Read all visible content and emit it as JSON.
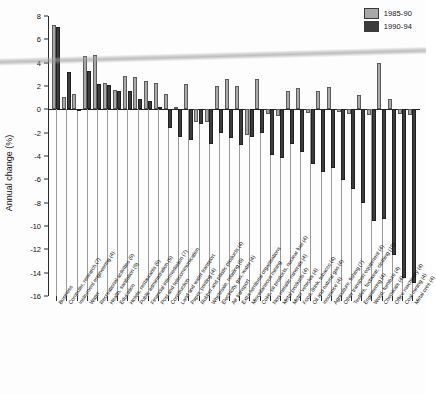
{
  "chart": {
    "ylabel": "Annual change (%)",
    "yticks": [
      8,
      6,
      4,
      2,
      0,
      -2,
      -4,
      -6,
      -8,
      -10,
      -12,
      -14,
      -16
    ],
    "legend": [
      {
        "label": "1985-90",
        "color": "#a9a9a9"
      },
      {
        "label": "1990-94",
        "color": "#3c3c3c"
      }
    ]
  },
  "chart_data": {
    "type": "bar",
    "title": "",
    "xlabel": "",
    "ylabel": "Annual change (%)",
    "ylim": [
      -16,
      8
    ],
    "grid": false,
    "legend_position": "top-right",
    "categories": [
      "Business",
      "Computer, research (7)",
      "Instrument engineering (4)",
      "Water",
      "Recreational activities (9)",
      "Health, sanitation (9)",
      "Education",
      "Hotels, restaurants (9)",
      "Public administration (9)",
      "Financial intermediation (7)",
      "Post and telecommunication",
      "Construction",
      "Land and water transport",
      "Paper, printing (4)",
      "Rubber and plastic products (4)",
      "Wholesale, retailing (6)",
      "Electricity, gas, water (4)",
      "Air transport",
      "Extra-territorial organisations",
      "Miscellaneous mining",
      "Coke, oil products, nuclear fuel (4)",
      "Non-metallic minerals (4)",
      "Metal products (4)",
      "Motor vehicles (4)",
      "Food, drink, tobacco (4)",
      "Oil and natural gas (4)",
      "Insurance (4)",
      "Agriculture, fishing (7)",
      "Other transport equipment (4)",
      "Textiles, footwear, clothing (10)",
      "Engineering (4)",
      "Wood, furniture (4)",
      "Chemicals (4)",
      "Office machinery (4)",
      "Coal mining (4)",
      "Metal ores (4)"
    ],
    "series": [
      {
        "name": "1985-90",
        "color": "#a9a9a9",
        "values": [
          7.2,
          1.1,
          1.3,
          4.6,
          4.7,
          2.3,
          1.7,
          2.9,
          2.8,
          2.4,
          2.3,
          1.3,
          0.2,
          2.2,
          -1.1,
          -1.1,
          2.0,
          2.6,
          2.0,
          -2.2,
          2.6,
          -0.4,
          -0.6,
          1.6,
          1.8,
          -0.3,
          1.6,
          1.9,
          -0.2,
          -0.4,
          1.2,
          -0.5,
          4.0,
          0.9,
          -0.4,
          -0.5
        ]
      },
      {
        "name": "1990-94",
        "color": "#3c3c3c",
        "values": [
          7.1,
          3.2,
          -0.1,
          3.3,
          2.2,
          2.1,
          1.6,
          1.6,
          0.9,
          0.7,
          0.2,
          -1.6,
          -2.4,
          -2.6,
          -1.3,
          -3.0,
          -2.0,
          -2.5,
          -3.1,
          -2.4,
          -2.0,
          -3.9,
          -4.2,
          -3.0,
          -3.7,
          -4.7,
          -5.4,
          -5.0,
          -6.1,
          -6.8,
          -8.0,
          -9.6,
          -9.4,
          -12.5,
          -14.5,
          -14.9
        ]
      }
    ]
  }
}
